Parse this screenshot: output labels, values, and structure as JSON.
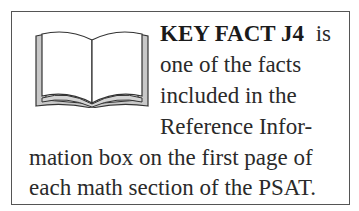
{
  "callout": {
    "icon": "open-book-icon",
    "heading": "KEY FACT J4",
    "lines": [
      "is",
      "one of the facts",
      "included in the",
      "Reference Infor-",
      "mation box on the first page of",
      "each math section of the PSAT."
    ]
  },
  "colors": {
    "border": "#555555",
    "text": "#2a2a2a",
    "book_fill": "#c8c8c8"
  }
}
